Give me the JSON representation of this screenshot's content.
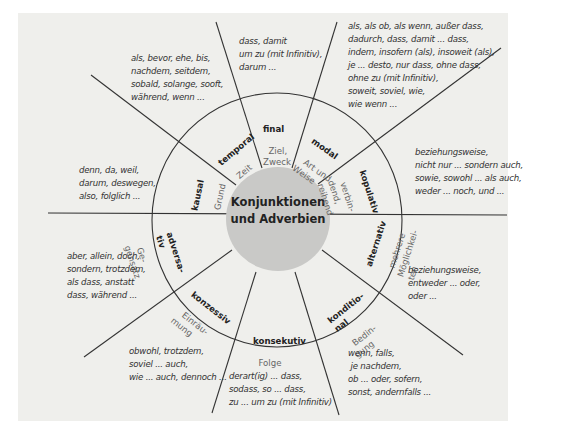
{
  "center": {
    "line1": "Konjunktionen",
    "line2": "und Adverbien"
  },
  "colors": {
    "panel_bg": "#efefec",
    "center_circle": "#c9c9c7",
    "lines": "#333333",
    "label_bold": "#222222",
    "label_sub": "#666666"
  },
  "segments": [
    {
      "id": "final",
      "title": "final",
      "subtitle": "Ziel,\nZweck",
      "examples": "dass, damit\num zu (mit Infinitiv),\ndarum ..."
    },
    {
      "id": "modal",
      "title": "modal",
      "subtitle": "Art und\nWeise",
      "examples": "als, als ob, als wenn, außer dass,\ndadurch, dass, damit ... dass,\nindem, insofern (als), insoweit (als),\nje ... desto, nur dass, ohne dass,\nohne zu (mit Infinitiv),\nsoweit, soviel, wie,\nwie wenn ..."
    },
    {
      "id": "kopulativ",
      "title": "kopulativ",
      "subtitle": "verbin-\ndend,\nreihend",
      "examples": "beziehungsweise,\nnicht nur ... sondern auch,\nsowie, sowohl ... als auch,\nweder ... noch, und ..."
    },
    {
      "id": "alternativ",
      "title": "alternativ",
      "subtitle": "mehrere\nMöglichkei-\nten",
      "examples": "beziehungsweise,\nentweder ... oder,\noder ..."
    },
    {
      "id": "konditional",
      "title": "konditio-\nnal",
      "subtitle": "Bedin-\ngung",
      "examples": "wenn, falls,\n je nachdem,\nob ... oder, sofern,\nsonst, andernfalls ..."
    },
    {
      "id": "konsekutiv",
      "title": "konsekutiv",
      "subtitle": "Folge",
      "examples": "derart(ig) ... dass,\nsodass, so ... dass,\nzu ... um zu (mit Infinitiv)"
    },
    {
      "id": "konzessiv",
      "title": "konzessiv",
      "subtitle": "Einräu-\nmung",
      "examples": "obwohl, trotzdem,\nsoviel ... auch,\nwie ... auch, dennoch ..."
    },
    {
      "id": "adversativ",
      "title": "adversa-\ntiv",
      "subtitle": "Ge-\ngensatz",
      "examples": "aber, allein, doch,\nsondern, trotzdem,\nals dass, anstatt\ndass, während ..."
    },
    {
      "id": "kausal",
      "title": "kausal",
      "subtitle": "Grund",
      "examples": "denn, da, weil,\ndarum, deswegen,\nalso, folglich ..."
    },
    {
      "id": "temporal",
      "title": "temporal",
      "subtitle": "Zeit",
      "examples": "als, bevor, ehe, bis,\nnachdem, seitdem,\nsobald, solange, sooft,\nwährend, wenn ..."
    }
  ]
}
